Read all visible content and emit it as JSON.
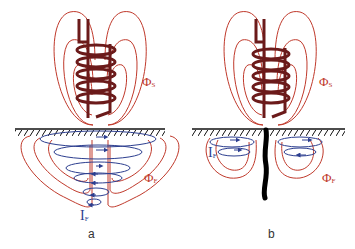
{
  "panels": [
    {
      "caption": "a",
      "labels": {
        "source_flux": "Φ",
        "source_flux_sub": "S",
        "eddy_flux": "Φ",
        "eddy_flux_sub": "F",
        "eddy_current": "I",
        "eddy_current_sub": "F"
      }
    },
    {
      "caption": "b",
      "labels": {
        "source_flux": "Φ",
        "source_flux_sub": "S",
        "eddy_flux": "Φ",
        "eddy_flux_sub": "F",
        "eddy_current": "I",
        "eddy_current_sub": "F"
      }
    }
  ],
  "colors": {
    "flux_lines": "#c0392b",
    "coil": "#6b1a1a",
    "eddy_current": "#2c3e8f",
    "surface": "#111111",
    "crack": "#000000"
  }
}
